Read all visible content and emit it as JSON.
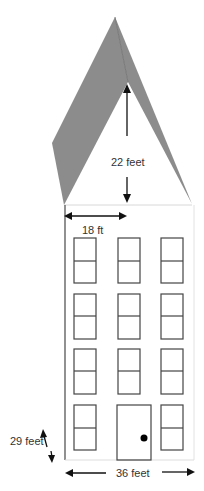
{
  "diagram": {
    "colors": {
      "roof": "#8c8c8c",
      "roof_edge": "#707070",
      "outline": "#555555",
      "wall_faint": "#d8d8d8",
      "arrow": "#111111",
      "text": "#333333",
      "doorknob": "#000000"
    },
    "labels": {
      "roof_height": "22 feet",
      "half_width": "18 ft",
      "wall_height": "29 feet",
      "total_width": "36 feet"
    },
    "facade": {
      "window_columns": 3,
      "window_rows": 4,
      "door": {
        "row": 4,
        "column": 2,
        "has_knob": true
      }
    }
  }
}
